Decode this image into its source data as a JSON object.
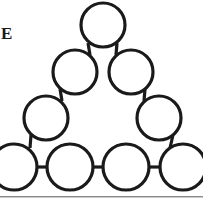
{
  "page": {
    "width": 203,
    "height": 207,
    "background_color": "#ffffff"
  },
  "label": {
    "text": "E",
    "name": "figure-label-e",
    "color": "#1a1a1a",
    "note_clipped": "left-cropped caption letter"
  },
  "divider": {
    "name": "bottom-horizontal-rule",
    "color": "#8d8d8d",
    "y": 196
  },
  "diagram": {
    "title": "E",
    "type": "triangle-circle-graph",
    "stroke_color": "#1a1a1a",
    "fill_color": "#ffffff",
    "stroke_width": 3.2,
    "node_count": 10,
    "edge_count": 9,
    "rows": [
      1,
      2,
      2,
      4
    ],
    "nodes": [
      {
        "id": "n1",
        "label": "",
        "row": 1,
        "cx": 103,
        "cy": 25,
        "r": 22,
        "clipped": false
      },
      {
        "id": "n2",
        "label": "",
        "row": 2,
        "cx": 75,
        "cy": 72,
        "r": 22,
        "clipped": false
      },
      {
        "id": "n3",
        "label": "",
        "row": 2,
        "cx": 131,
        "cy": 72,
        "r": 22,
        "clipped": false
      },
      {
        "id": "n4",
        "label": "",
        "row": 3,
        "cx": 46,
        "cy": 118,
        "r": 22,
        "clipped": false
      },
      {
        "id": "n5",
        "label": "",
        "row": 3,
        "cx": 159,
        "cy": 118,
        "r": 22,
        "clipped": false
      },
      {
        "id": "n6",
        "label": "",
        "row": 4,
        "cx": 14,
        "cy": 167,
        "r": 23,
        "clipped": true
      },
      {
        "id": "n7",
        "label": "",
        "row": 4,
        "cx": 70,
        "cy": 167,
        "r": 23,
        "clipped": false
      },
      {
        "id": "n8",
        "label": "",
        "row": 4,
        "cx": 126,
        "cy": 167,
        "r": 23,
        "clipped": false
      },
      {
        "id": "n9",
        "label": "",
        "row": 4,
        "cx": 183,
        "cy": 167,
        "r": 23,
        "clipped": true
      }
    ],
    "edges": [
      {
        "id": "e1",
        "from": "n1",
        "to": "n2"
      },
      {
        "id": "e2",
        "from": "n1",
        "to": "n3"
      },
      {
        "id": "e3",
        "from": "n2",
        "to": "n4"
      },
      {
        "id": "e4",
        "from": "n3",
        "to": "n5"
      },
      {
        "id": "e5",
        "from": "n4",
        "to": "n6"
      },
      {
        "id": "e6",
        "from": "n5",
        "to": "n9"
      },
      {
        "id": "e7",
        "from": "n6",
        "to": "n7"
      },
      {
        "id": "e8",
        "from": "n7",
        "to": "n8"
      },
      {
        "id": "e9",
        "from": "n8",
        "to": "n9"
      }
    ]
  }
}
